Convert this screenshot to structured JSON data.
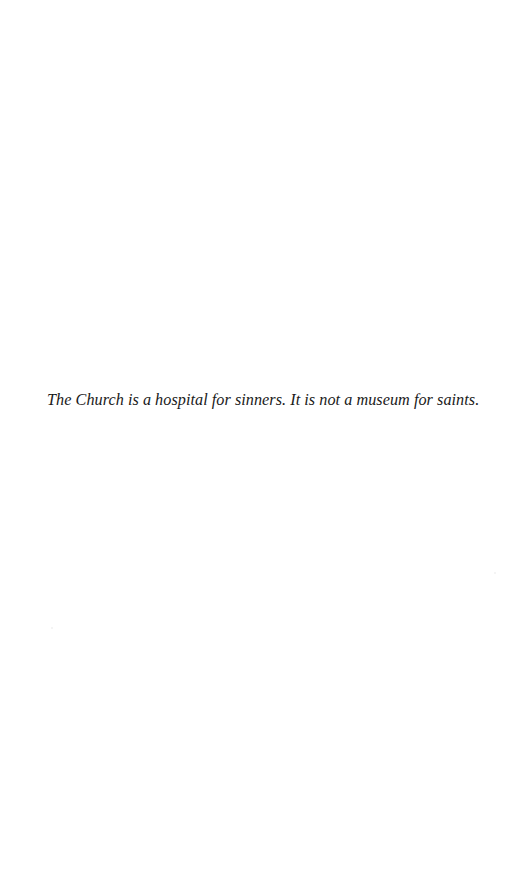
{
  "document": {
    "quote": "The Church is a hospital for sinners. It is not a museum for saints."
  },
  "colors": {
    "background": "#ffffff",
    "text": "#1a1a1a"
  }
}
